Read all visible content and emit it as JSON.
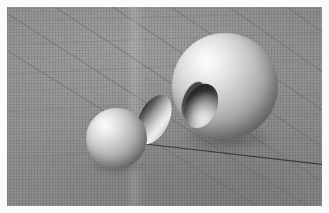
{
  "scene": {
    "title": "3D CSG boolean render viewport",
    "description": "Grey perspective ground grid with three shaded solids",
    "background_color": "#8e8e8e",
    "matte_color": "#fbfbfb",
    "light_direction": "upper-left"
  },
  "grid": {
    "name": "perspective-ground-grid",
    "major_line_color": "#6f6f6f",
    "minor_line_color": "#848484",
    "micro_line_color": "#7d7d7d",
    "axis_line_color": "#3a3a3a",
    "axis_line_label": "x-axis",
    "major_divisions": 9,
    "minor_per_major": 5
  },
  "objects": [
    {
      "id": "sphere-large",
      "label": "Large sphere with spherical cavity",
      "kind": "sphere-difference",
      "center": [
        224,
        86
      ],
      "radius": 53,
      "highlight_color": "#fdfdfd",
      "shadow_color": "#636363"
    },
    {
      "id": "lens-shape",
      "label": "Lens intersection solid",
      "kind": "sphere-intersection",
      "center": [
        154,
        119
      ],
      "width": 30,
      "height": 53,
      "rotation_deg": 26,
      "highlight_color": "#efefef",
      "shadow_color": "#2f2f2f"
    },
    {
      "id": "sphere-small",
      "label": "Small sphere",
      "kind": "sphere",
      "center": [
        116,
        138
      ],
      "radius": 30,
      "highlight_color": "#fbfbfb",
      "shadow_color": "#6b6b6b"
    }
  ],
  "cavity": {
    "id": "sphere-large-cavity",
    "label": "Concave spherical cavity",
    "rim_color": "#3b3b3b",
    "interior_color": "#d2d2d2"
  }
}
